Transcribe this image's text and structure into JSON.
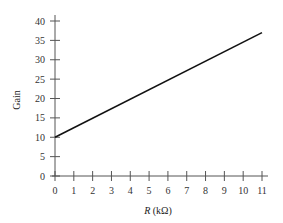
{
  "chart_data": {
    "type": "line",
    "title": "",
    "xlabel": "R (kΩ)",
    "ylabel": "Gain",
    "xlim": [
      0,
      11
    ],
    "ylim": [
      0,
      40
    ],
    "grid": false,
    "legend": null,
    "x_ticks": [
      0,
      1,
      2,
      3,
      4,
      5,
      6,
      7,
      8,
      9,
      10,
      11
    ],
    "y_ticks": [
      0,
      5,
      10,
      15,
      20,
      25,
      30,
      35,
      40
    ],
    "series": [
      {
        "name": "Gain",
        "x": [
          0,
          11
        ],
        "values": [
          10,
          37
        ],
        "color": "#111111"
      }
    ]
  },
  "labels": {
    "xlabel_italic": "R",
    "xlabel_unit": " (kΩ)",
    "ylabel": "Gain"
  }
}
